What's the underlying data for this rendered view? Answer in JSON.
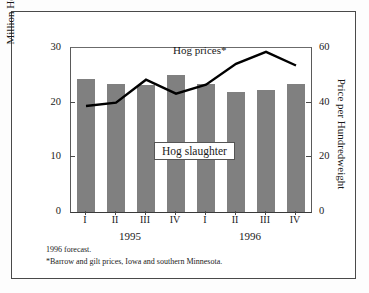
{
  "chart_data": {
    "type": "bar",
    "title": "",
    "categories": [
      "I",
      "II",
      "III",
      "IV",
      "I",
      "II",
      "III",
      "IV"
    ],
    "group_labels": [
      "1995",
      "1996"
    ],
    "groups": [
      {
        "label": "1995",
        "quarters": [
          "I",
          "II",
          "III",
          "IV"
        ]
      },
      {
        "label": "1996",
        "quarters": [
          "I",
          "II",
          "III",
          "IV"
        ]
      }
    ],
    "xlabel": "",
    "ylabel": "Million Head",
    "y2label": "Price per Hundredweight",
    "ylim": [
      0,
      30
    ],
    "y2lim": [
      0,
      60
    ],
    "yticks": [
      0,
      10,
      20,
      30
    ],
    "y2ticks": [
      0,
      20,
      40,
      60
    ],
    "grid": false,
    "legend_position": "inline-annotation",
    "series": [
      {
        "name": "Hog slaughter",
        "type": "bar",
        "axis": "left",
        "unit": "Million Head",
        "color": "#808080",
        "values": [
          24.3,
          23.5,
          23.2,
          25.0,
          23.5,
          21.9,
          22.4,
          23.5
        ]
      },
      {
        "name": "Hog prices*",
        "type": "line",
        "axis": "right",
        "unit": "Price per Hundredweight",
        "color": "#000000",
        "values": [
          38.8,
          40.0,
          48.4,
          43.3,
          46.6,
          54.2,
          58.6,
          53.6
        ]
      }
    ],
    "annotations": [
      {
        "name": "line-series-label",
        "text": "Hog prices*"
      },
      {
        "name": "bar-series-label",
        "text": "Hog slaughter"
      }
    ],
    "footnotes": [
      "1996 forecast.",
      "*Barrow and gilt prices, Iowa and southern Minnesota."
    ]
  },
  "axes": {
    "left": {
      "label": "Million Head",
      "ticks": [
        "0",
        "10",
        "20",
        "30"
      ]
    },
    "right": {
      "label": "Price per Hundredweight",
      "ticks": [
        "0",
        "20",
        "40",
        "60"
      ]
    },
    "bottom": {
      "ticks": [
        "I",
        "II",
        "III",
        "IV",
        "I",
        "II",
        "III",
        "IV"
      ],
      "groups": [
        "1995",
        "1996"
      ]
    }
  },
  "labels": {
    "line_series": "Hog prices*",
    "bar_series": "Hog slaughter"
  },
  "footnotes": {
    "line1": "1996 forecast.",
    "line2": "*Barrow and gilt prices, Iowa and southern Minnesota."
  },
  "colors": {
    "bar": "#808080",
    "line": "#000000",
    "frame": "#4a4a4a",
    "background": "#ffffff"
  }
}
